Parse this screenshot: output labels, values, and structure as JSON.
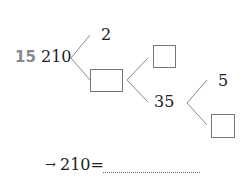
{
  "problem": {
    "number": "15",
    "root": "210",
    "level1": {
      "top": "2",
      "bottom_box": ""
    },
    "level2": {
      "top_box": "",
      "bottom": "35"
    },
    "level3": {
      "top": "5",
      "bottom_box": ""
    },
    "answer_line": {
      "arrow": "→",
      "expression": "210=",
      "blank": ""
    }
  },
  "colors": {
    "line": "#8c8c8c",
    "box_border": "#777777",
    "number_label": "#8a8a8a"
  }
}
